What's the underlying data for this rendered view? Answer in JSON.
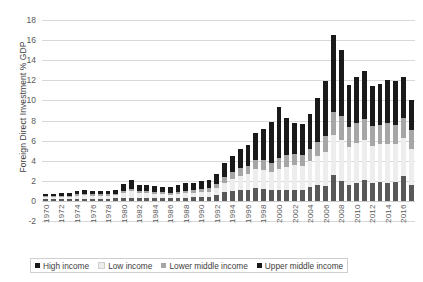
{
  "chart_data": {
    "type": "bar",
    "stacked": true,
    "title": "",
    "subtitle": "",
    "xlabel": "",
    "ylabel": "Foreign Direct Investment % GDP",
    "ylim": [
      -2,
      18
    ],
    "ytick_values": [
      -2,
      0,
      2,
      4,
      6,
      8,
      10,
      12,
      14,
      16,
      18
    ],
    "ytick_labels": [
      "-2",
      "0",
      "2",
      "4",
      "6",
      "8",
      "10",
      "12",
      "14",
      "16",
      "18"
    ],
    "grid": true,
    "legend_position": "bottom",
    "colors": {
      "high_income": "#1a1a1a",
      "low_income": "#ededed",
      "lower_middle_income": "#a6a6a6",
      "upper_middle_income": "#595959",
      "gridline": "#d8d8d8",
      "text": "#404040"
    },
    "categories": [
      "1970",
      "1971",
      "1972",
      "1973",
      "1974",
      "1975",
      "1976",
      "1977",
      "1978",
      "1979",
      "1980",
      "1981",
      "1982",
      "1983",
      "1984",
      "1985",
      "1986",
      "1987",
      "1988",
      "1989",
      "1990",
      "1991",
      "1992",
      "1993",
      "1994",
      "1995",
      "1996",
      "1997",
      "1998",
      "1999",
      "2000",
      "2001",
      "2002",
      "2003",
      "2004",
      "2005",
      "2006",
      "2007",
      "2008",
      "2009",
      "2010",
      "2011",
      "2012",
      "2013",
      "2014",
      "2015",
      "2016",
      "2017"
    ],
    "xtick_labels": [
      "1970",
      "1972",
      "1974",
      "1976",
      "1978",
      "1980",
      "1982",
      "1984",
      "1986",
      "1988",
      "1990",
      "1992",
      "1994",
      "1996",
      "1998",
      "2000",
      "2002",
      "2004",
      "2006",
      "2008",
      "2010",
      "2012",
      "2014",
      "2016"
    ],
    "stack_order_bottom_to_top": [
      "Upper middle income",
      "Low income",
      "Lower middle income",
      "High income"
    ],
    "series": [
      {
        "name": "Upper middle income",
        "color": "#595959",
        "values": [
          0.15,
          0.15,
          0.15,
          0.15,
          0.2,
          0.2,
          0.2,
          0.2,
          0.2,
          0.25,
          0.25,
          0.3,
          0.25,
          0.25,
          0.25,
          0.25,
          0.25,
          0.3,
          0.3,
          0.35,
          0.4,
          0.4,
          0.55,
          0.85,
          1.0,
          1.05,
          1.05,
          1.25,
          1.15,
          1.05,
          1.05,
          1.1,
          1.05,
          1.1,
          1.4,
          1.55,
          1.5,
          2.55,
          1.95,
          1.55,
          1.8,
          2.1,
          1.75,
          1.85,
          1.8,
          1.9,
          2.45,
          1.55
        ]
      },
      {
        "name": "Low income",
        "color": "#ededed",
        "values": [
          0.2,
          0.2,
          0.25,
          0.25,
          0.3,
          0.35,
          0.3,
          0.3,
          0.3,
          0.3,
          0.55,
          0.65,
          0.5,
          0.5,
          0.45,
          0.4,
          0.35,
          0.4,
          0.45,
          0.45,
          0.45,
          0.5,
          0.7,
          0.95,
          1.2,
          1.45,
          1.65,
          1.9,
          1.95,
          1.85,
          2.1,
          2.3,
          2.55,
          2.35,
          2.55,
          2.95,
          3.35,
          4.05,
          4.15,
          3.85,
          3.95,
          3.95,
          3.75,
          3.8,
          3.9,
          3.75,
          3.85,
          3.6
        ]
      },
      {
        "name": "Lower middle income",
        "color": "#a6a6a6",
        "values": [
          0.1,
          0.1,
          0.1,
          0.1,
          0.15,
          0.15,
          0.15,
          0.15,
          0.15,
          0.15,
          0.2,
          0.25,
          0.2,
          0.2,
          0.2,
          0.2,
          0.2,
          0.2,
          0.25,
          0.25,
          0.3,
          0.35,
          0.45,
          0.55,
          0.65,
          0.75,
          0.8,
          0.95,
          0.95,
          0.9,
          1.15,
          1.15,
          1.05,
          1.1,
          1.25,
          1.4,
          1.65,
          2.2,
          2.35,
          1.95,
          2.0,
          2.15,
          1.95,
          1.95,
          2.05,
          1.95,
          2.0,
          1.9
        ]
      },
      {
        "name": "High income",
        "color": "#1a1a1a",
        "values": [
          0.25,
          0.25,
          0.25,
          0.3,
          0.35,
          0.35,
          0.35,
          0.3,
          0.3,
          0.35,
          0.7,
          0.85,
          0.65,
          0.6,
          0.55,
          0.55,
          0.55,
          0.65,
          0.75,
          0.75,
          0.8,
          0.8,
          0.95,
          1.4,
          1.65,
          1.9,
          2.05,
          2.65,
          3.1,
          4.1,
          5.05,
          3.75,
          3.15,
          3.1,
          3.45,
          4.35,
          5.45,
          7.7,
          6.55,
          4.15,
          4.6,
          4.7,
          3.95,
          4.0,
          4.3,
          4.3,
          4.05,
          3.0
        ]
      }
    ],
    "totals_note": "Stacked totals peak at ~16.5 in 2007"
  },
  "legend": {
    "items": [
      {
        "label": "High income",
        "swatch": "s3"
      },
      {
        "label": "Low income",
        "swatch": "s1"
      },
      {
        "label": "Lower middle income",
        "swatch": "s2"
      },
      {
        "label": "Upper middle income",
        "swatch": "s0"
      }
    ]
  }
}
